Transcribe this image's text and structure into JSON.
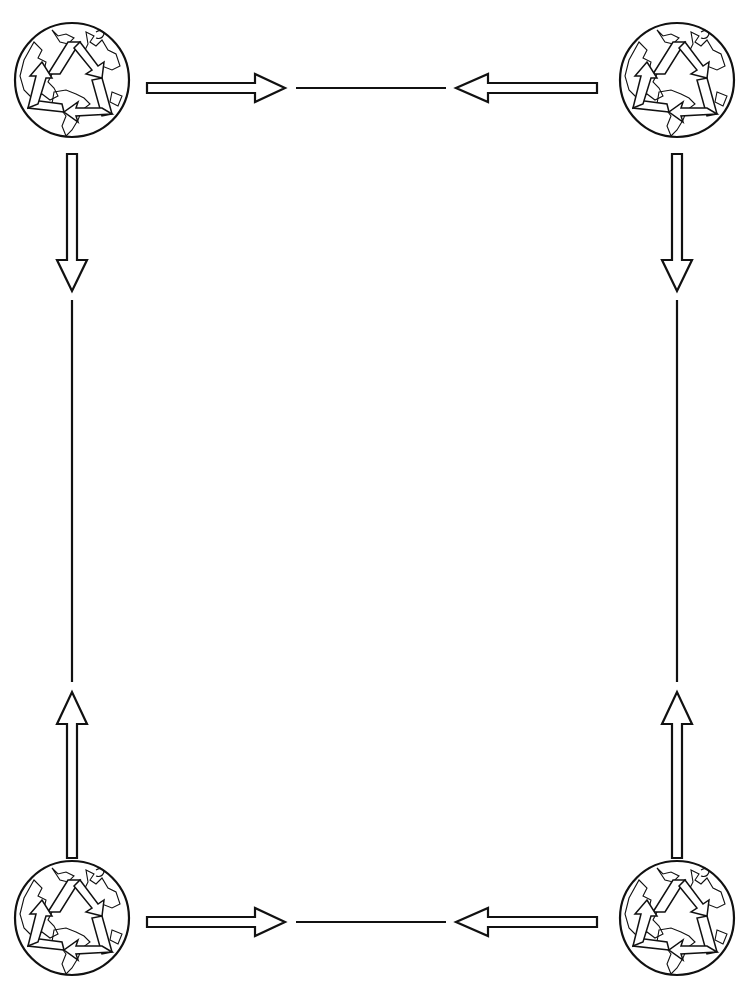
{
  "page": {
    "width": 748,
    "height": 994,
    "background": "#ffffff",
    "stroke_color": "#111111",
    "fill_color": "#ffffff"
  },
  "corners": [
    {
      "name": "top-left",
      "icon": "recycle-globe-icon",
      "cx": 72,
      "cy": 80,
      "r": 57
    },
    {
      "name": "top-right",
      "icon": "recycle-globe-icon",
      "cx": 677,
      "cy": 80,
      "r": 57
    },
    {
      "name": "bottom-left",
      "icon": "recycle-globe-icon",
      "cx": 72,
      "cy": 918,
      "r": 57
    },
    {
      "name": "bottom-right",
      "icon": "recycle-globe-icon",
      "cx": 677,
      "cy": 918,
      "r": 57
    }
  ],
  "arrows": [
    {
      "edge": "top",
      "direction": "right",
      "x1": 147,
      "x2": 285,
      "y": 88
    },
    {
      "edge": "top",
      "direction": "left",
      "x1": 456,
      "x2": 597,
      "y": 88
    },
    {
      "edge": "bottom",
      "direction": "right",
      "x1": 147,
      "x2": 285,
      "y": 922
    },
    {
      "edge": "bottom",
      "direction": "left",
      "x1": 456,
      "x2": 597,
      "y": 922
    },
    {
      "edge": "left",
      "direction": "down",
      "x": 72,
      "y1": 153,
      "y2": 293
    },
    {
      "edge": "left",
      "direction": "up",
      "x": 72,
      "y1": 690,
      "y2": 858
    },
    {
      "edge": "right",
      "direction": "down",
      "x": 677,
      "y1": 153,
      "y2": 293
    },
    {
      "edge": "right",
      "direction": "up",
      "x": 677,
      "y1": 690,
      "y2": 858
    }
  ],
  "connector_lines": [
    {
      "edge": "top",
      "x1": 296,
      "y1": 88,
      "x2": 446,
      "y2": 88
    },
    {
      "edge": "bottom",
      "x1": 296,
      "y1": 922,
      "x2": 446,
      "y2": 922
    },
    {
      "edge": "left",
      "x1": 72,
      "y1": 300,
      "x2": 72,
      "y2": 682
    },
    {
      "edge": "right",
      "x1": 677,
      "y1": 300,
      "x2": 677,
      "y2": 682
    }
  ]
}
